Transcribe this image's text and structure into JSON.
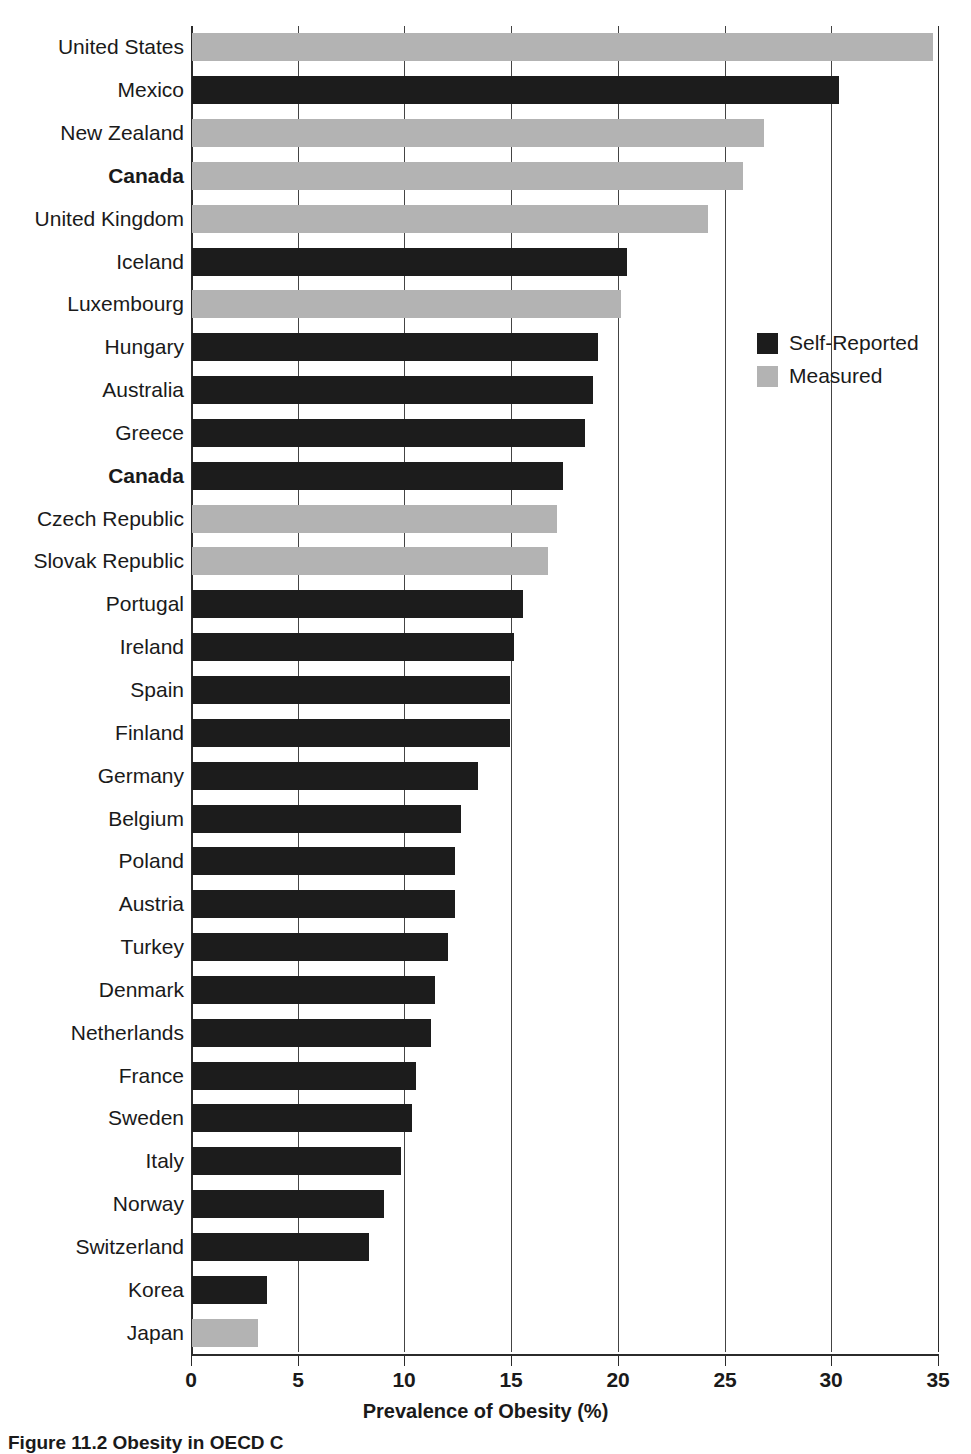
{
  "chart_data": {
    "type": "bar",
    "orientation": "horizontal",
    "title": "",
    "xlabel": "Prevalence of Obesity (%)",
    "ylabel": "",
    "xlim": [
      0,
      35
    ],
    "xticks": [
      0,
      5,
      10,
      15,
      20,
      25,
      30,
      35
    ],
    "grid": true,
    "legend_position": "upper-right-inside",
    "series": [
      {
        "name": "Self-Reported",
        "color": "#1c1c1c",
        "key": "selfrep"
      },
      {
        "name": "Measured",
        "color": "#b3b3b3",
        "key": "measured"
      }
    ],
    "categories": [
      "United States",
      "Mexico",
      "New Zealand",
      "Canada",
      "United Kingdom",
      "Iceland",
      "Luxembourg",
      "Hungary",
      "Australia",
      "Greece",
      "Canada",
      "Czech Republic",
      "Slovak Republic",
      "Portugal",
      "Ireland",
      "Spain",
      "Finland",
      "Germany",
      "Belgium",
      "Poland",
      "Austria",
      "Turkey",
      "Denmark",
      "Netherlands",
      "France",
      "Sweden",
      "Italy",
      "Norway",
      "Switzerland",
      "Korea",
      "Japan"
    ],
    "values": [
      34.7,
      30.3,
      26.8,
      25.8,
      24.2,
      20.4,
      20.1,
      19.0,
      18.8,
      18.4,
      17.4,
      17.1,
      16.7,
      15.5,
      15.1,
      14.9,
      14.9,
      13.4,
      12.6,
      12.3,
      12.3,
      12.0,
      11.4,
      11.2,
      10.5,
      10.3,
      9.8,
      9.0,
      8.3,
      3.5,
      3.1
    ],
    "bar_types": [
      "measured",
      "selfrep",
      "measured",
      "measured",
      "measured",
      "selfrep",
      "measured",
      "selfrep",
      "selfrep",
      "selfrep",
      "selfrep",
      "measured",
      "measured",
      "selfrep",
      "selfrep",
      "selfrep",
      "selfrep",
      "selfrep",
      "selfrep",
      "selfrep",
      "selfrep",
      "selfrep",
      "selfrep",
      "selfrep",
      "selfrep",
      "selfrep",
      "selfrep",
      "selfrep",
      "selfrep",
      "selfrep",
      "measured"
    ],
    "bold_labels": [
      "Canada"
    ]
  },
  "legend": {
    "items": [
      {
        "label": "Self-Reported",
        "swatch": "selfrep"
      },
      {
        "label": "Measured",
        "swatch": "measured"
      }
    ]
  },
  "axis": {
    "x_title": "Prevalence of Obesity (%)",
    "tick_labels": [
      "0",
      "5",
      "10",
      "15",
      "20",
      "25",
      "30",
      "35"
    ]
  },
  "caption": {
    "text": "Figure 11.2 Obesity in OECD C"
  },
  "colors": {
    "self_reported": "#1c1c1c",
    "measured": "#b3b3b3",
    "axis": "#2b2b2b",
    "grid": "#444444",
    "text": "#1a1a1a",
    "background": "#ffffff"
  }
}
